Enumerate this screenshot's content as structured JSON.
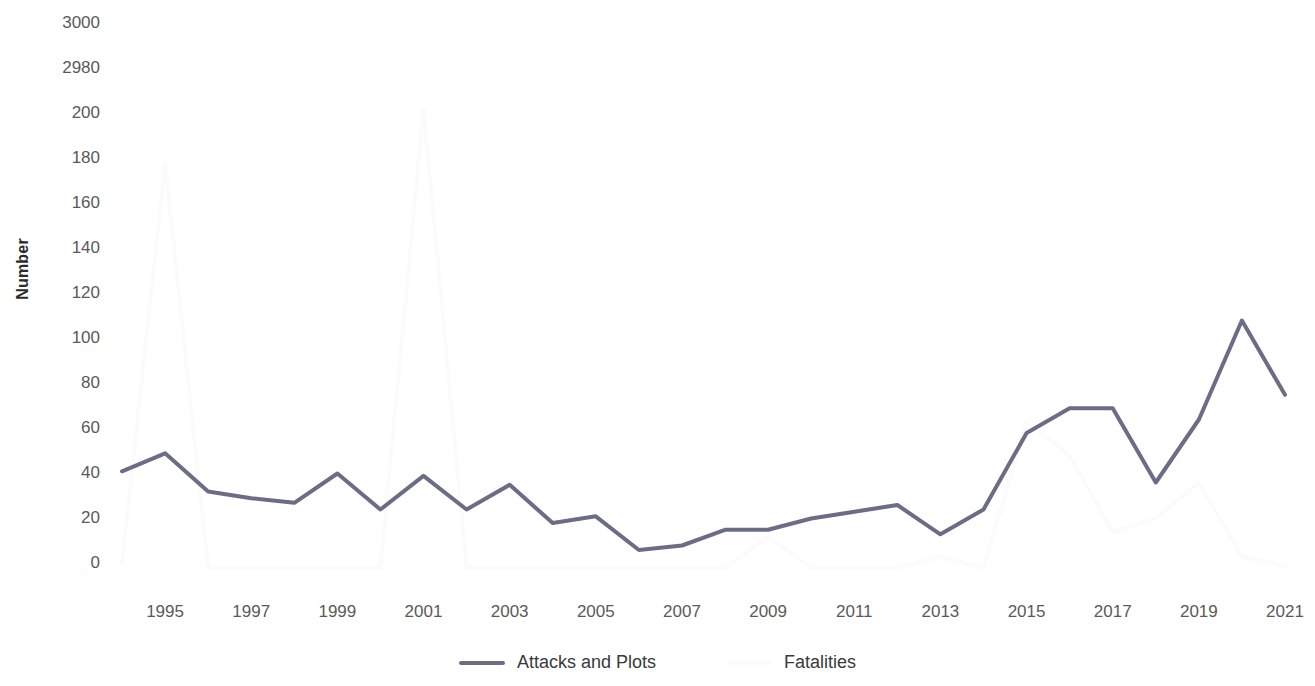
{
  "chart_data": {
    "type": "line",
    "title": "",
    "xlabel": "",
    "ylabel": "Number",
    "x": [
      1994,
      1995,
      1996,
      1997,
      1998,
      1999,
      2000,
      2001,
      2002,
      2003,
      2004,
      2005,
      2006,
      2007,
      2008,
      2009,
      2010,
      2011,
      2012,
      2013,
      2014,
      2015,
      2016,
      2017,
      2018,
      2019,
      2020,
      2021
    ],
    "xtick_labels": [
      "1995",
      "1997",
      "1999",
      "2001",
      "2003",
      "2005",
      "2007",
      "2009",
      "2011",
      "2013",
      "2015",
      "2017",
      "2019",
      "2021"
    ],
    "ytick_labels": [
      "3000",
      "2980",
      "200",
      "180",
      "160",
      "140",
      "120",
      "100",
      "80",
      "60",
      "40",
      "20",
      "0"
    ],
    "ylim": [
      0,
      200
    ],
    "y_axis_break": true,
    "y_break_note": "axis breaks between 200 and 2980",
    "grid": false,
    "legend_position": "bottom",
    "series": [
      {
        "name": "Attacks and Plots",
        "color": "#6b6d87",
        "values": [
          43,
          51,
          34,
          31,
          29,
          42,
          26,
          41,
          26,
          37,
          20,
          23,
          8,
          10,
          17,
          17,
          22,
          25,
          28,
          15,
          26,
          60,
          71,
          71,
          38,
          66,
          110,
          77
        ]
      },
      {
        "name": "Fatalities",
        "color": "#fbfbfc",
        "values": [
          2,
          180,
          0,
          0,
          0,
          0,
          0,
          2977,
          0,
          0,
          0,
          0,
          0,
          0,
          0,
          14,
          0,
          0,
          0,
          5,
          0,
          65,
          50,
          16,
          22,
          38,
          5,
          1
        ]
      }
    ]
  },
  "legend": {
    "items": [
      {
        "label": "Attacks and Plots",
        "color": "#6b6d87"
      },
      {
        "label": "Fatalities",
        "color": "#fbfbfc"
      }
    ]
  },
  "axes": {
    "y_title": "Number"
  }
}
